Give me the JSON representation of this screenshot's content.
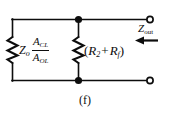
{
  "figure": {
    "caption": "(f)",
    "background_color": "#ffffff",
    "line_color": "#0d0d0d"
  },
  "labels": {
    "source_impedance": {
      "symbol": "Z",
      "symbol_sub": "o"
    },
    "gain_ratio": {
      "numerator": "A",
      "numerator_sub": "CL",
      "denominator": "A",
      "denominator_sub": "OL"
    },
    "resistor_branch": {
      "open_paren": "(",
      "first": "R",
      "first_sub": "2",
      "operator": "+",
      "second": "R",
      "second_sub": "f",
      "close_paren": ")"
    },
    "output_impedance": {
      "symbol": "Z",
      "symbol_sub": "out"
    }
  },
  "components": {
    "left_resistor": "resistor-zigzag",
    "middle_resistor": "resistor-zigzag",
    "top_node": "junction-dot",
    "bottom_node": "junction-dot",
    "top_terminal": "open-terminal",
    "bottom_terminal": "open-terminal",
    "direction_arrow": "arrow-left"
  }
}
